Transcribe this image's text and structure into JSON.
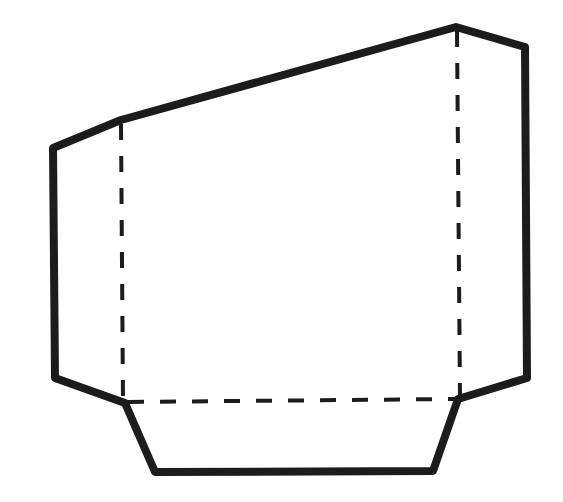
{
  "diagram": {
    "title": "",
    "type": "net / folded shape outline",
    "width": 563,
    "height": 502,
    "colors": {
      "background": "#ffffff",
      "stroke": "#1c1c1c"
    },
    "outline": {
      "stroke_width": 8,
      "points": [
        [
          53,
          148
        ],
        [
          121,
          120
        ],
        [
          456,
          27
        ],
        [
          525,
          47
        ],
        [
          527,
          378
        ],
        [
          458,
          399
        ],
        [
          433,
          471
        ],
        [
          155,
          472
        ],
        [
          125,
          403
        ],
        [
          55,
          378
        ]
      ]
    },
    "fold_lines": [
      {
        "name": "left-fold-line",
        "x1": 121,
        "y1": 124,
        "x2": 123,
        "y2": 401
      },
      {
        "name": "right-fold-line",
        "x1": 457,
        "y1": 31,
        "x2": 460,
        "y2": 397
      },
      {
        "name": "bottom-fold-line",
        "x1": 128,
        "y1": 402,
        "x2": 456,
        "y2": 399
      }
    ],
    "dash": {
      "stroke_width": 4,
      "pattern": "16 16"
    }
  }
}
